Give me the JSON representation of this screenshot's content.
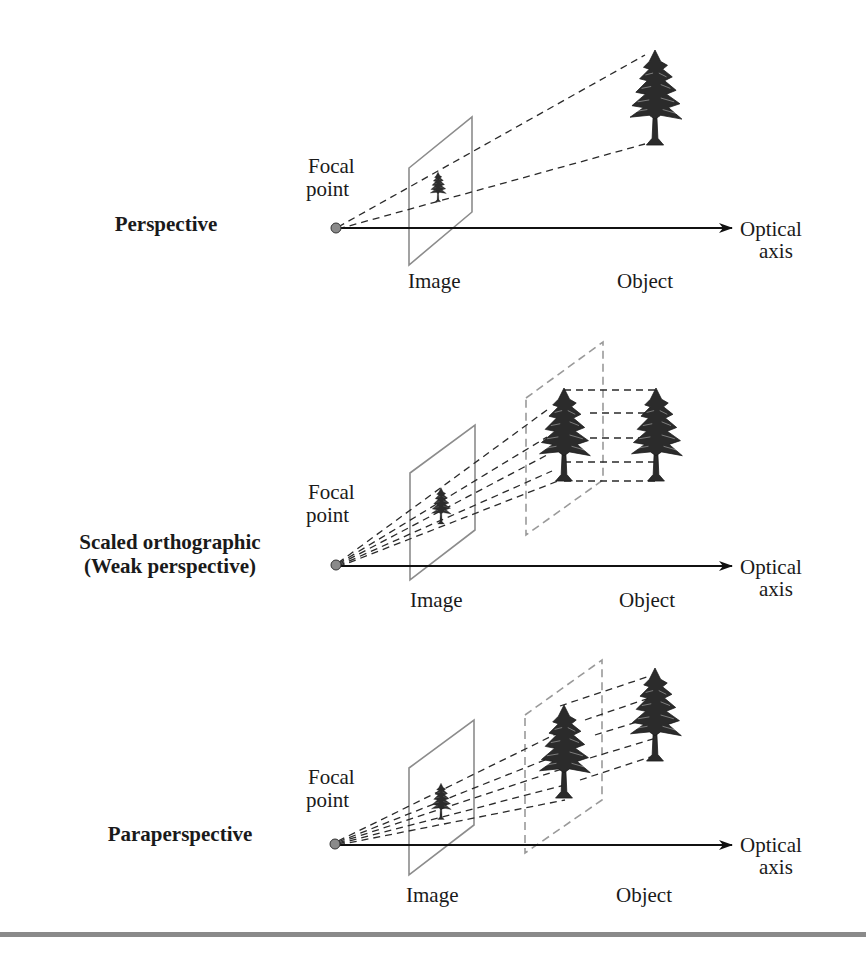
{
  "panels": [
    {
      "title": "Perspective",
      "focal_label_line1": "Focal",
      "focal_label_line2": "point",
      "image_label": "Image",
      "object_label": "Object",
      "axis_label_line1": "Optical",
      "axis_label_line2": "axis"
    },
    {
      "title_line1": "Scaled orthographic",
      "title_line2": "(Weak perspective)",
      "focal_label_line1": "Focal",
      "focal_label_line2": "point",
      "image_label": "Image",
      "object_label": "Object",
      "axis_label_line1": "Optical",
      "axis_label_line2": "axis"
    },
    {
      "title": "Paraperspective",
      "focal_label_line1": "Focal",
      "focal_label_line2": "point",
      "image_label": "Image",
      "object_label": "Object",
      "axis_label_line1": "Optical",
      "axis_label_line2": "axis"
    }
  ],
  "colors": {
    "plane_solid": "#8c8c8c",
    "plane_dashed": "#9a9a9a",
    "projection_dash": "#2a2a2a",
    "axis": "#111111",
    "focal_dot": "#8a8a8a",
    "tree": "#2b2b2b",
    "bottom_rule": "#8a8a8a"
  }
}
